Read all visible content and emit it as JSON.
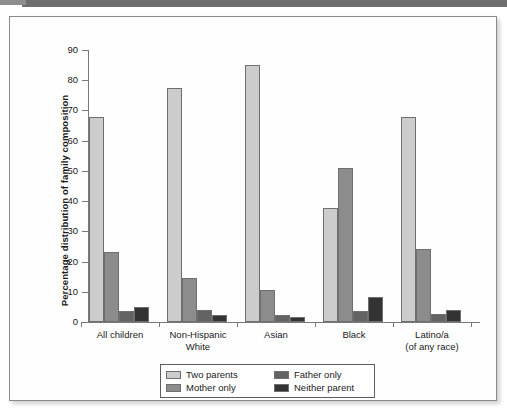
{
  "chart_data": {
    "type": "bar",
    "title": "",
    "xlabel": "",
    "ylabel": "Percentage distribution of family composition",
    "ylim": [
      0,
      90
    ],
    "yticks": [
      0,
      10,
      20,
      30,
      40,
      50,
      60,
      70,
      80,
      90
    ],
    "grid": false,
    "legend_position": "bottom-center",
    "categories": [
      "All children",
      "Non-Hispanic\nWhite",
      "Asian",
      "Black",
      "Latino/a\n(of any race)"
    ],
    "category_lines": [
      [
        "All children"
      ],
      [
        "Non-Hispanic",
        "White"
      ],
      [
        "Asian"
      ],
      [
        "Black"
      ],
      [
        "Latino/a",
        "(of any race)"
      ]
    ],
    "series": [
      {
        "name": "Two parents",
        "color": "#cccccc",
        "values": [
          68.0,
          77.5,
          85.0,
          37.7,
          67.7
        ]
      },
      {
        "name": "Mother only",
        "color": "#8c8c8c",
        "values": [
          23.3,
          14.6,
          10.5,
          51.0,
          24.3
        ]
      },
      {
        "name": "Father only",
        "color": "#636363",
        "values": [
          3.5,
          4.0,
          2.3,
          3.5,
          2.6
        ]
      },
      {
        "name": "Neither parent",
        "color": "#333333",
        "values": [
          5.0,
          2.3,
          1.5,
          8.2,
          4.0
        ]
      }
    ]
  },
  "legend": {
    "entries": [
      {
        "label": "Two parents",
        "color": "#cccccc"
      },
      {
        "label": "Father only",
        "color": "#636363"
      },
      {
        "label": "Mother only",
        "color": "#8c8c8c"
      },
      {
        "label": "Neither parent",
        "color": "#333333"
      }
    ]
  }
}
